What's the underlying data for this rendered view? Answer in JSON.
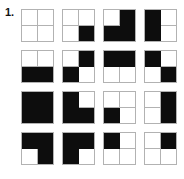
{
  "question": {
    "number_label": "1.",
    "item_count": 16,
    "grid_columns": 4,
    "grid_rows": 4
  },
  "colors": {
    "filled": "#0d0d0d",
    "empty": "#ffffff",
    "gridline": "#b2b2b2",
    "background": "#ffffff",
    "label_text": "#111111"
  },
  "legend": {
    "quadrant_order": [
      "top-left",
      "top-right",
      "bottom-left",
      "bottom-right"
    ],
    "value_meaning": {
      "0": "white",
      "1": "black"
    }
  },
  "patterns": [
    {
      "index": 1,
      "row": 1,
      "col": 1,
      "cells": [
        0,
        0,
        0,
        0
      ],
      "filled_count": 0
    },
    {
      "index": 2,
      "row": 1,
      "col": 2,
      "cells": [
        0,
        0,
        0,
        1
      ],
      "filled_count": 1
    },
    {
      "index": 3,
      "row": 1,
      "col": 3,
      "cells": [
        0,
        1,
        1,
        1
      ],
      "filled_count": 3
    },
    {
      "index": 4,
      "row": 1,
      "col": 4,
      "cells": [
        1,
        0,
        1,
        0
      ],
      "filled_count": 2
    },
    {
      "index": 5,
      "row": 2,
      "col": 1,
      "cells": [
        0,
        0,
        1,
        1
      ],
      "filled_count": 2
    },
    {
      "index": 6,
      "row": 2,
      "col": 2,
      "cells": [
        0,
        1,
        1,
        0
      ],
      "filled_count": 2
    },
    {
      "index": 7,
      "row": 2,
      "col": 3,
      "cells": [
        1,
        1,
        0,
        0
      ],
      "filled_count": 2
    },
    {
      "index": 8,
      "row": 2,
      "col": 4,
      "cells": [
        1,
        0,
        0,
        1
      ],
      "filled_count": 2
    },
    {
      "index": 9,
      "row": 3,
      "col": 1,
      "cells": [
        1,
        1,
        1,
        1
      ],
      "filled_count": 4
    },
    {
      "index": 10,
      "row": 3,
      "col": 2,
      "cells": [
        1,
        0,
        1,
        1
      ],
      "filled_count": 3
    },
    {
      "index": 11,
      "row": 3,
      "col": 3,
      "cells": [
        0,
        0,
        1,
        0
      ],
      "filled_count": 1
    },
    {
      "index": 12,
      "row": 3,
      "col": 4,
      "cells": [
        0,
        1,
        0,
        1
      ],
      "filled_count": 2
    },
    {
      "index": 13,
      "row": 4,
      "col": 1,
      "cells": [
        1,
        1,
        0,
        1
      ],
      "filled_count": 3
    },
    {
      "index": 14,
      "row": 4,
      "col": 2,
      "cells": [
        1,
        1,
        1,
        0
      ],
      "filled_count": 3
    },
    {
      "index": 15,
      "row": 4,
      "col": 3,
      "cells": [
        1,
        0,
        0,
        0
      ],
      "filled_count": 1
    },
    {
      "index": 16,
      "row": 4,
      "col": 4,
      "cells": [
        0,
        1,
        0,
        0
      ],
      "filled_count": 1
    }
  ]
}
